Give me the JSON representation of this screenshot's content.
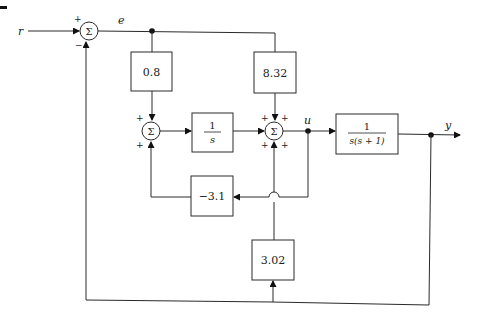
{
  "signals": {
    "r": "r",
    "e": "e",
    "u": "u",
    "y": "y"
  },
  "summers": {
    "sum1": {
      "label": "Σ",
      "signs": [
        "+",
        "−"
      ]
    },
    "sum2": {
      "label": "Σ",
      "signs": [
        "+",
        "+"
      ]
    },
    "sum3": {
      "label": "Σ",
      "signs": [
        "+",
        "+",
        "+",
        "+"
      ]
    }
  },
  "blocks": {
    "gain_0_8": "0.8",
    "gain_8_32": "8.32",
    "integrator": {
      "num": "1",
      "den": "s"
    },
    "plant": {
      "num": "1",
      "den": "s(s + 1)"
    },
    "gain_neg_3_1": "−3.1",
    "gain_3_02": "3.02"
  }
}
